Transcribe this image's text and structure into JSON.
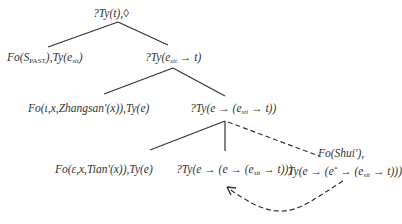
{
  "diagram": {
    "type": "tree",
    "style": {
      "line_color": "#333333",
      "text_color": "#333333",
      "background": "#ffffff"
    },
    "nodes": {
      "root": {
        "label": "?Ty(t),◊"
      },
      "fo_past": {
        "pre": "Fo(S",
        "sub": "PAST",
        "mid": "),Ty(e",
        "sub2": "sit",
        "post": ")"
      },
      "ty_esit_t": {
        "pre": "?Ty(e",
        "sub": "sit",
        "post": " → t)"
      },
      "zhangsan": {
        "label": "Fo(ι,x,Zhangsan'(x)),Ty(e)"
      },
      "ty_e_esit_t": {
        "pre": "?Ty(e → (e",
        "sub": "sit",
        "post": " → t))"
      },
      "tian": {
        "label": "Fo(ε,x,Tian'(x)),Ty(e)"
      },
      "ty_e_e_esit_t": {
        "pre": "?Ty(e → (e → (e",
        "sub": "sit",
        "post": " → t)))"
      },
      "shui_fo": {
        "label": "Fo(Shui'),"
      },
      "shui_ty": {
        "pre": "Ty(e → (e",
        "sup": "*",
        "mid": " → (e",
        "sub": "sit",
        "post": " → t)))"
      }
    },
    "edges": [
      {
        "from": "root",
        "to": "fo_past",
        "style": "solid"
      },
      {
        "from": "root",
        "to": "ty_esit_t",
        "style": "solid"
      },
      {
        "from": "ty_esit_t",
        "to": "zhangsan",
        "style": "solid"
      },
      {
        "from": "ty_esit_t",
        "to": "ty_e_esit_t",
        "style": "solid"
      },
      {
        "from": "ty_e_esit_t",
        "to": "tian",
        "style": "solid"
      },
      {
        "from": "ty_e_esit_t",
        "to": "ty_e_e_esit_t",
        "style": "solid"
      },
      {
        "from": "ty_e_esit_t",
        "to": "shui",
        "style": "dashed"
      },
      {
        "from": "shui",
        "to": "ty_e_e_esit_t",
        "style": "dashed-curved-arrow"
      }
    ]
  }
}
